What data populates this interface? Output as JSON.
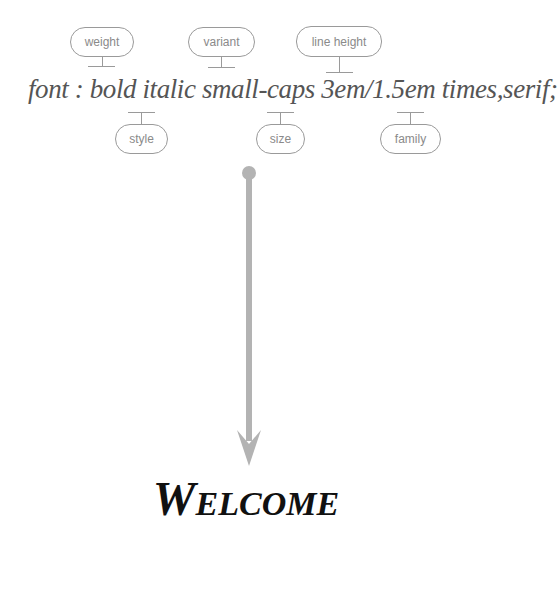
{
  "diagram": {
    "syntax_line": "font : bold italic small-caps 3em/1.5em times,serif;",
    "labels_top": [
      {
        "label": "weight"
      },
      {
        "label": "variant"
      },
      {
        "label": "line height"
      }
    ],
    "labels_bottom": [
      {
        "label": "style"
      },
      {
        "label": "size"
      },
      {
        "label": "family"
      }
    ],
    "result_text": "Welcome",
    "colors": {
      "label_border": "#9a9a9a",
      "label_text": "#8a8a8a",
      "syntax_text": "#555555",
      "arrow": "#b3b3b3",
      "result_text": "#111111"
    }
  }
}
